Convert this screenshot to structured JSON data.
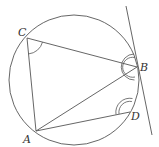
{
  "diagram": {
    "type": "circle-geometry",
    "circle": {
      "cx": 74,
      "cy": 80,
      "r": 65
    },
    "points": {
      "A": {
        "x": 36,
        "y": 131,
        "label": "A",
        "lx": 23,
        "ly": 143
      },
      "B": {
        "x": 137,
        "y": 67,
        "label": "B",
        "lx": 140,
        "ly": 71
      },
      "C": {
        "x": 27,
        "y": 38,
        "label": "C",
        "lx": 18,
        "ly": 36
      },
      "D": {
        "x": 130,
        "y": 112,
        "label": "D",
        "lx": 131,
        "ly": 120
      }
    },
    "segments": [
      [
        "C",
        "B"
      ],
      [
        "C",
        "A"
      ],
      [
        "A",
        "B"
      ],
      [
        "A",
        "D"
      ]
    ],
    "tangent": {
      "x1": 126,
      "y1": 6,
      "x2": 152,
      "y2": 135,
      "at": "B"
    },
    "angle_marks": [
      {
        "at": "C",
        "count": 1
      },
      {
        "at": "B",
        "count": 2
      },
      {
        "at": "D",
        "count": 2
      }
    ],
    "colors": {
      "line": "#555555",
      "label": "#333333"
    }
  }
}
